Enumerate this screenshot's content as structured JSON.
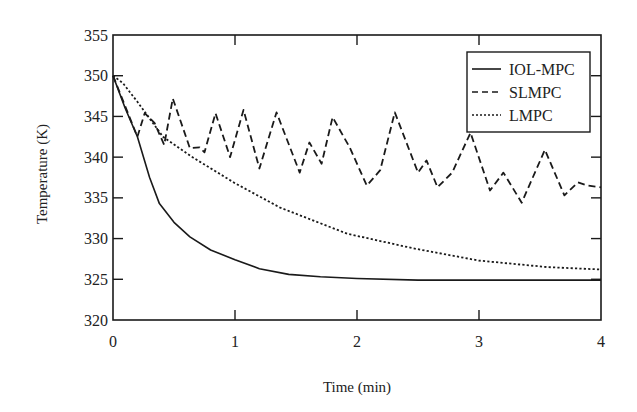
{
  "chart_data": {
    "type": "line",
    "title": "",
    "xlabel": "Time (min)",
    "ylabel": "Temperature (K)",
    "xlim": [
      0,
      4
    ],
    "ylim": [
      320,
      355
    ],
    "xticks": [
      0,
      1,
      2,
      3,
      4
    ],
    "yticks": [
      320,
      325,
      330,
      335,
      340,
      345,
      350,
      355
    ],
    "grid": false,
    "legend_position": "upper right",
    "series": [
      {
        "name": "IOL-MPC",
        "style": "solid",
        "x": [
          0,
          0.1,
          0.2,
          0.3,
          0.38,
          0.5,
          0.63,
          0.8,
          1.0,
          1.2,
          1.44,
          1.7,
          2.0,
          2.5,
          3.0,
          3.5,
          4.0
        ],
        "y": [
          350.0,
          346.0,
          342.5,
          337.5,
          334.3,
          332.0,
          330.2,
          328.6,
          327.4,
          326.3,
          325.6,
          325.3,
          325.1,
          324.9,
          324.9,
          324.9,
          324.9
        ]
      },
      {
        "name": "SLMPC",
        "style": "dashed",
        "x": [
          0,
          0.2,
          0.26,
          0.34,
          0.42,
          0.49,
          0.63,
          0.71,
          0.75,
          0.84,
          0.96,
          1.07,
          1.2,
          1.34,
          1.53,
          1.61,
          1.71,
          1.8,
          1.94,
          2.08,
          2.19,
          2.31,
          2.5,
          2.57,
          2.66,
          2.78,
          2.93,
          3.09,
          3.2,
          3.35,
          3.54,
          3.7,
          3.81,
          3.89,
          4.0
        ],
        "y": [
          350.0,
          342.5,
          345.4,
          344.2,
          341.5,
          347.2,
          341.1,
          341.2,
          340.6,
          345.4,
          340.0,
          345.8,
          338.6,
          345.5,
          338.1,
          341.8,
          339.2,
          344.9,
          341.2,
          336.5,
          338.4,
          345.5,
          338.1,
          339.6,
          336.3,
          338.1,
          343.0,
          335.9,
          338.1,
          334.4,
          340.9,
          335.3,
          336.9,
          336.5,
          336.3
        ]
      },
      {
        "name": "LMPC",
        "style": "dotted",
        "x": [
          0,
          0.08,
          0.2,
          0.41,
          0.65,
          1.0,
          1.37,
          1.92,
          2.46,
          3.0,
          3.56,
          4.0
        ],
        "y": [
          350.0,
          349.1,
          346.8,
          342.5,
          340.0,
          336.8,
          333.8,
          330.6,
          328.8,
          327.3,
          326.5,
          326.2
        ]
      }
    ]
  },
  "labels": {
    "xlabel": "Time (min)",
    "ylabel": "Temperature (K)",
    "legend": [
      "IOL-MPC",
      "SLMPC",
      "LMPC"
    ]
  }
}
